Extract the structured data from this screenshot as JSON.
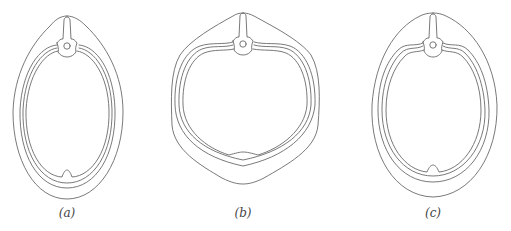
{
  "figure": {
    "panels": [
      {
        "id": "a",
        "label": "(a)",
        "shape": "narrow-oval cross-section"
      },
      {
        "id": "b",
        "label": "(b)",
        "shape": "rounded heart-shaped cross-section"
      },
      {
        "id": "c",
        "label": "(c)",
        "shape": "broad-oval cross-section"
      }
    ],
    "line_color": "#6a6a6a",
    "background": "#ffffff"
  }
}
